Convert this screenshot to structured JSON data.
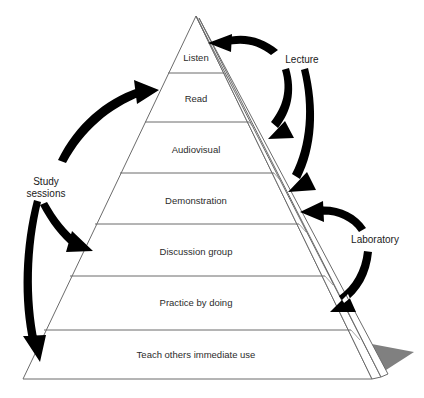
{
  "diagram": {
    "type": "pyramid",
    "background_color": "#ffffff",
    "outline_color": "#6b6b6b",
    "text_color": "#2b2b2b",
    "arrow_color": "#000000",
    "shadow_color": "#808080",
    "tiers": [
      {
        "label": "Listen"
      },
      {
        "label": "Read"
      },
      {
        "label": "Audiovisual"
      },
      {
        "label": "Demonstration"
      },
      {
        "label": "Discussion group"
      },
      {
        "label": "Practice by doing"
      },
      {
        "label": "Teach others immediate use"
      }
    ],
    "annotations": [
      {
        "label": "Study",
        "label2": "sessions",
        "side": "left"
      },
      {
        "label": "Lecture",
        "side": "right"
      },
      {
        "label": "Laboratory",
        "side": "right"
      }
    ]
  }
}
